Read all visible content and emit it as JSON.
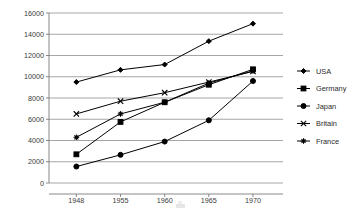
{
  "chart_data": {
    "type": "line",
    "title": "",
    "subtitle": "",
    "xlabel": "",
    "ylabel": "",
    "categories": [
      "1948",
      "1955",
      "1960",
      "1965",
      "1970"
    ],
    "x_tick_labels": [
      "1948",
      "1955",
      "1960",
      "1965",
      "1970"
    ],
    "y_tick_labels": [
      "0",
      "2000",
      "4000",
      "6000",
      "8000",
      "10000",
      "12000",
      "14000",
      "16000"
    ],
    "y_ticks": [
      0,
      2000,
      4000,
      6000,
      8000,
      10000,
      12000,
      14000,
      16000
    ],
    "ylim": [
      0,
      16000
    ],
    "grid": "horizontal",
    "legend_position": "right",
    "series": [
      {
        "name": "USA",
        "marker": "diamond",
        "values": [
          9500,
          10650,
          11150,
          13350,
          15000
        ]
      },
      {
        "name": "Germany",
        "marker": "square",
        "values": [
          2700,
          5750,
          7600,
          9250,
          10700
        ]
      },
      {
        "name": "Japan",
        "marker": "circle",
        "values": [
          1550,
          2650,
          3900,
          5900,
          9600
        ]
      },
      {
        "name": "Britain",
        "marker": "x",
        "values": [
          6500,
          7700,
          8500,
          9500,
          10500
        ]
      },
      {
        "name": "France",
        "marker": "star",
        "values": [
          4300,
          6500,
          7600,
          9400,
          10550
        ]
      }
    ]
  },
  "legend": {
    "entries": [
      {
        "label": "USA"
      },
      {
        "label": "Germany"
      },
      {
        "label": "Japan"
      },
      {
        "label": "Britain"
      },
      {
        "label": "France"
      }
    ]
  },
  "colors": {
    "series": "#000000",
    "grid": "#8f8f8f",
    "axis": "#7a7a7a",
    "text": "#2b2b2b",
    "background": "#ffffff"
  }
}
